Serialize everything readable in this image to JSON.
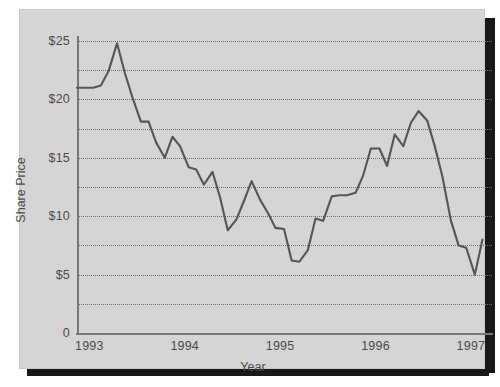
{
  "figure": {
    "background_color": "#d5d5d5",
    "page_color": "#ffffff",
    "shadow_color": "#181818",
    "line_color": "#555555",
    "grid_color": "#6e6e6e",
    "axis_color": "#777777",
    "text_color": "#4a4a4a"
  },
  "chart_data": {
    "type": "line",
    "title": "",
    "xlabel": "Year",
    "ylabel": "Share Price",
    "xlim": [
      1993,
      1997.35
    ],
    "ylim": [
      0,
      25
    ],
    "grid": true,
    "grid_step": 2.5,
    "legend": "none",
    "x_tick_labels": [
      "1993",
      "1994",
      "1995",
      "1996",
      "1997"
    ],
    "x_tick_values": [
      1993,
      1994,
      1995,
      1996,
      1997
    ],
    "y_tick_labels": [
      "$25",
      "$20",
      "$15",
      "$10",
      "$5",
      "0"
    ],
    "y_tick_values": [
      25,
      20,
      15,
      10,
      5,
      0
    ],
    "series": [
      {
        "name": "Share Price",
        "x": [
          1993.0,
          1993.08,
          1993.17,
          1993.25,
          1993.33,
          1993.42,
          1993.5,
          1993.58,
          1993.67,
          1993.75,
          1993.83,
          1993.92,
          1994.0,
          1994.08,
          1994.17,
          1994.25,
          1994.33,
          1994.42,
          1994.5,
          1994.58,
          1994.67,
          1994.75,
          1994.83,
          1994.92,
          1995.0,
          1995.08,
          1995.17,
          1995.25,
          1995.33,
          1995.42,
          1995.5,
          1995.58,
          1995.67,
          1995.75,
          1995.83,
          1995.92,
          1996.0,
          1996.08,
          1996.17,
          1996.25,
          1996.33,
          1996.42,
          1996.5,
          1996.58,
          1996.67,
          1996.75,
          1996.83,
          1996.92,
          1997.0,
          1997.08,
          1997.17,
          1997.25
        ],
        "y": [
          21.0,
          21.0,
          21.0,
          21.2,
          22.4,
          24.8,
          22.3,
          20.2,
          18.1,
          18.1,
          16.3,
          15.0,
          16.8,
          16.0,
          14.2,
          14.0,
          12.7,
          13.8,
          11.6,
          8.8,
          9.7,
          11.3,
          13.0,
          11.4,
          10.3,
          9.0,
          8.9,
          6.2,
          6.1,
          7.1,
          9.8,
          9.6,
          11.7,
          11.8,
          11.8,
          12.0,
          13.5,
          15.8,
          15.8,
          14.3,
          17.0,
          16.0,
          18.0,
          19.0,
          18.2,
          16.0,
          13.4,
          9.6,
          7.5,
          7.3,
          5.0,
          8.0
        ]
      }
    ],
    "annotations": []
  }
}
